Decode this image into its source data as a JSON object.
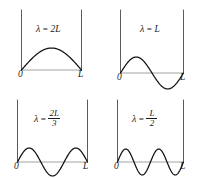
{
  "figure": {
    "background_color": "#ffffff",
    "curve_color": "#111111",
    "wall_color": "#4a4a4a",
    "baseline_color": "#8a8a8a"
  },
  "panels": [
    {
      "id": "mode-1",
      "lambda_symbol": "λ",
      "equals": "=",
      "value_text": "2L",
      "value_kind": "plain",
      "numerator": "",
      "denominator": "",
      "left_tick_label": "0",
      "right_tick_label": "L",
      "half_waves": 1,
      "harmonic": 1
    },
    {
      "id": "mode-2",
      "lambda_symbol": "λ",
      "equals": "=",
      "value_text": "L",
      "value_kind": "plain",
      "numerator": "",
      "denominator": "",
      "left_tick_label": "0",
      "right_tick_label": "L",
      "half_waves": 2,
      "harmonic": 2
    },
    {
      "id": "mode-3",
      "lambda_symbol": "λ",
      "equals": "=",
      "value_text": "",
      "value_kind": "fraction",
      "numerator": "2L",
      "denominator": "3",
      "left_tick_label": "0",
      "right_tick_label": "L",
      "half_waves": 3,
      "harmonic": 3
    },
    {
      "id": "mode-4",
      "lambda_symbol": "λ",
      "equals": "=",
      "value_text": "",
      "value_kind": "fraction",
      "numerator": "L",
      "denominator": "2",
      "left_tick_label": "0",
      "right_tick_label": "L",
      "half_waves": 4,
      "harmonic": 4
    }
  ],
  "chart_data": {
    "type": "line",
    "xlabel": "",
    "ylabel": "",
    "xlim": [
      0,
      1
    ],
    "grid": false,
    "legend_position": "none",
    "annotations": [
      "λ = 2L",
      "λ = L",
      "λ = 2L/3",
      "λ = L/2"
    ],
    "series": [
      {
        "name": "λ = 2L",
        "harmonic": 1,
        "function": "sin(1*pi*x/L)",
        "nodes": [
          0,
          1
        ],
        "antinodes": [
          0.5
        ]
      },
      {
        "name": "λ = L",
        "harmonic": 2,
        "function": "sin(2*pi*x/L)",
        "nodes": [
          0,
          0.5,
          1
        ],
        "antinodes": [
          0.25,
          0.75
        ]
      },
      {
        "name": "λ = 2L/3",
        "harmonic": 3,
        "function": "sin(3*pi*x/L)",
        "nodes": [
          0,
          0.3333,
          0.6667,
          1
        ],
        "antinodes": [
          0.1667,
          0.5,
          0.8333
        ]
      },
      {
        "name": "λ = L/2",
        "harmonic": 4,
        "function": "sin(4*pi*x/L)",
        "nodes": [
          0,
          0.25,
          0.5,
          0.75,
          1
        ],
        "antinodes": [
          0.125,
          0.375,
          0.625,
          0.875
        ]
      }
    ],
    "tick_labels": {
      "x": [
        "0",
        "L"
      ]
    }
  }
}
